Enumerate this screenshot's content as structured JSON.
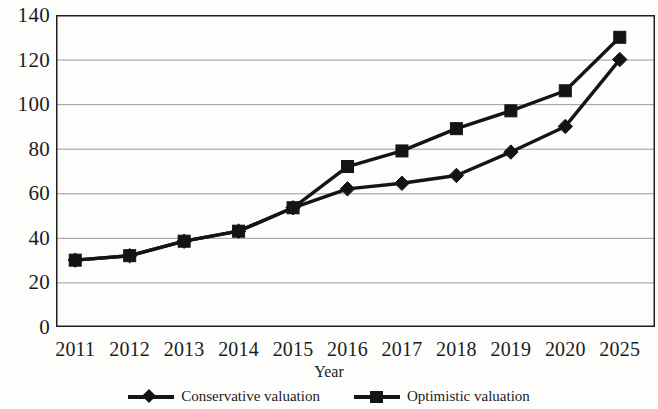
{
  "chart_data": {
    "type": "line",
    "title": "",
    "subtitle": "",
    "xlabel": "Year",
    "ylabel": "",
    "categories": [
      "2011",
      "2012",
      "2013",
      "2014",
      "2015",
      "2016",
      "2017",
      "2018",
      "2019",
      "2020",
      "2025"
    ],
    "series": [
      {
        "name": "Conservative valuation",
        "marker": "diamond",
        "color": "#141414",
        "values": [
          30,
          32,
          38.5,
          43,
          53.5,
          62,
          64.5,
          68,
          78.5,
          90,
          120
        ]
      },
      {
        "name": "Optimistic valuation",
        "marker": "square",
        "color": "#141414",
        "values": [
          30,
          32,
          38.5,
          43,
          53.5,
          72,
          79,
          89,
          97,
          106,
          130
        ]
      }
    ],
    "ylim": [
      0,
      140
    ],
    "yticks": [
      0,
      20,
      40,
      60,
      80,
      100,
      120,
      140
    ],
    "ytick_labels": [
      "0",
      "20",
      "40",
      "60",
      "80",
      "100",
      "120",
      "140"
    ],
    "grid": "horizontal",
    "legend_position": "bottom",
    "frame": "box"
  },
  "axis": {
    "x_title": "Year"
  },
  "legend": {
    "entries": [
      {
        "label": "Conservative valuation",
        "marker": "diamond-marker-icon"
      },
      {
        "label": "Optimistic valuation",
        "marker": "square-marker-icon"
      }
    ]
  }
}
